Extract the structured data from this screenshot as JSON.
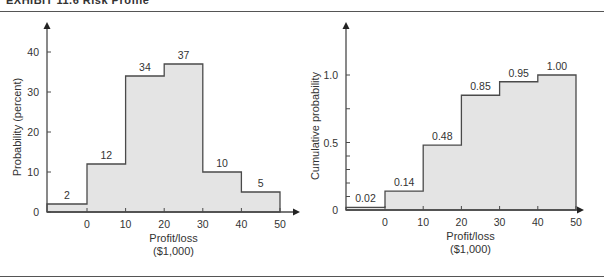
{
  "header": {
    "title": "EXHIBIT 11.6  Risk Profile"
  },
  "colors": {
    "fill": "#e4e4e4",
    "stroke": "#4a4a4a",
    "text": "#333333"
  },
  "chart_data": [
    {
      "type": "bar",
      "subtype": "step-histogram",
      "title": "",
      "xlabel": "Profit/loss ($1,000)",
      "xlabel_lines": [
        "Profit/loss",
        "($1,000)"
      ],
      "ylabel": "Probability (percent)",
      "x_ticks": [
        0,
        10,
        20,
        30,
        40,
        50
      ],
      "y_ticks": [
        0,
        10,
        20,
        30,
        40
      ],
      "ylim": [
        0,
        45
      ],
      "categories": [
        "<0",
        "0-10",
        "10-20",
        "20-30",
        "30-40",
        "40-50"
      ],
      "bins": [
        [
          -10,
          0
        ],
        [
          0,
          10
        ],
        [
          10,
          20
        ],
        [
          20,
          30
        ],
        [
          30,
          40
        ],
        [
          40,
          50
        ]
      ],
      "values": [
        2,
        12,
        34,
        37,
        10,
        5
      ],
      "labels": [
        "2",
        "12",
        "34",
        "37",
        "10",
        "5"
      ],
      "grid": false
    },
    {
      "type": "area",
      "subtype": "step-cumulative",
      "title": "",
      "xlabel": "Profit/loss ($1,000)",
      "xlabel_lines": [
        "Profit/loss",
        "($1,000)"
      ],
      "ylabel": "Cumulative probability",
      "x_ticks": [
        0,
        10,
        20,
        30,
        40,
        50
      ],
      "y_ticks": [
        0,
        0.5,
        1.0
      ],
      "y_tick_labels": [
        "0",
        "0.5",
        "1.0"
      ],
      "ylim": [
        0,
        1.2
      ],
      "categories": [
        "<0",
        "0-10",
        "10-20",
        "20-30",
        "30-40",
        "40-50"
      ],
      "bins": [
        [
          -10,
          0
        ],
        [
          0,
          10
        ],
        [
          10,
          20
        ],
        [
          20,
          30
        ],
        [
          30,
          40
        ],
        [
          40,
          50
        ]
      ],
      "values": [
        0.02,
        0.14,
        0.48,
        0.85,
        0.95,
        1.0
      ],
      "labels": [
        "0.02",
        "0.14",
        "0.48",
        "0.85",
        "0.95",
        "1.00"
      ],
      "grid": false
    }
  ]
}
